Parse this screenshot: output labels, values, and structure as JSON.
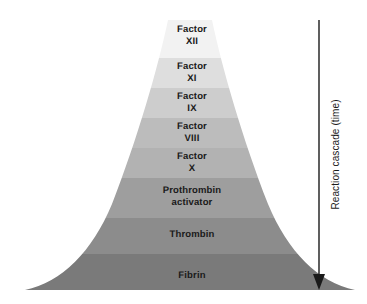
{
  "figure": {
    "type": "funnel-diagram",
    "background_color": "#ffffff",
    "text_color": "#1a1a1a"
  },
  "chart_data": {
    "type": "funnel",
    "title": "",
    "xlabel": "",
    "ylabel": "Reaction cascade (time)",
    "grid": false,
    "legend": "none",
    "orientation": "vertical-expanding",
    "note": "Width of each band represents the amplified amount of activated product at that step of the cascade.",
    "categories": [
      "Factor XII",
      "Factor XI",
      "Factor IX",
      "Factor VIII",
      "Factor X",
      "Prothrombin activator",
      "Thrombin",
      "Fibrin"
    ],
    "stages": [
      {
        "index": 1,
        "label": "Factor\nXII",
        "name": "Factor XII",
        "numeral": "XII",
        "fill": "#f2f2f2",
        "y_top": 20,
        "y_bottom": 58,
        "half_width_top": 20,
        "half_width_bottom": 23
      },
      {
        "index": 2,
        "label": "Factor\nXI",
        "name": "Factor XI",
        "numeral": "XI",
        "fill": "#dedede",
        "y_top": 58,
        "y_bottom": 88,
        "half_width_top": 23,
        "half_width_bottom": 28
      },
      {
        "index": 3,
        "label": "Factor\nIX",
        "name": "Factor IX",
        "numeral": "IX",
        "fill": "#cdcdcd",
        "y_top": 88,
        "y_bottom": 118,
        "half_width_top": 28,
        "half_width_bottom": 36
      },
      {
        "index": 4,
        "label": "Factor\nVIII",
        "name": "Factor VIII",
        "numeral": "VIII",
        "fill": "#bcbcbc",
        "y_top": 118,
        "y_bottom": 148,
        "half_width_top": 36,
        "half_width_bottom": 47
      },
      {
        "index": 5,
        "label": "Factor\nX",
        "name": "Factor X",
        "numeral": "X",
        "fill": "#b2b2b2",
        "y_top": 148,
        "y_bottom": 178,
        "half_width_top": 47,
        "half_width_bottom": 62
      },
      {
        "index": 6,
        "label": "Prothrombin\nactivator",
        "name": "Prothrombin activator",
        "numeral": "",
        "fill": "#9e9e9e",
        "y_top": 178,
        "y_bottom": 218,
        "half_width_top": 62,
        "half_width_bottom": 92
      },
      {
        "index": 7,
        "label": "Thrombin",
        "name": "Thrombin",
        "numeral": "",
        "fill": "#8c8c8c",
        "y_top": 218,
        "y_bottom": 254,
        "half_width_top": 92,
        "half_width_bottom": 128
      },
      {
        "index": 8,
        "label": "Fibrin",
        "name": "Fibrin",
        "numeral": "",
        "fill": "#7a7a7a",
        "y_top": 254,
        "y_bottom": 290,
        "half_width_top": 128,
        "half_width_bottom": 165
      }
    ]
  },
  "axis": {
    "caption": "Reaction cascade (time)",
    "arrow": {
      "direction": "down",
      "color": "#1a1a1a",
      "x": 319,
      "y_start": 20,
      "y_end": 289
    }
  }
}
